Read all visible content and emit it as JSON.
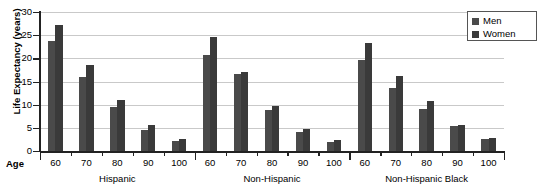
{
  "axes": {
    "ylabel": "Life Expectancy (years)",
    "age_label": "Age",
    "yticks": [
      "30",
      "25",
      "20",
      "15",
      "10",
      "5",
      "0"
    ]
  },
  "legend": {
    "items": [
      {
        "label": "Men",
        "color": "#4a4a4a",
        "icon": "square-swatch-icon"
      },
      {
        "label": "Women",
        "color": "#3a3a3a",
        "icon": "square-swatch-icon"
      }
    ]
  },
  "chart_data": {
    "type": "bar",
    "title": "",
    "xlabel": "Age",
    "ylabel": "Life Expectancy (years)",
    "ylim": [
      0,
      30
    ],
    "yticks": [
      0,
      5,
      10,
      15,
      20,
      25,
      30
    ],
    "grid": true,
    "legend_position": "top-right",
    "groups": [
      "Hispanic",
      "Non-Hispanic",
      "Non-Hispanic Black"
    ],
    "categories": [
      "60",
      "70",
      "80",
      "90",
      "100"
    ],
    "series": [
      {
        "name": "Men",
        "color": "#4a4a4a",
        "values_by_group": {
          "Hispanic": [
            23.7,
            16.0,
            9.4,
            4.5,
            2.1
          ],
          "Non-Hispanic": [
            20.8,
            16.6,
            8.9,
            4.2,
            1.9
          ],
          "Non-Hispanic Black": [
            19.6,
            13.6,
            9.0,
            5.3,
            2.5
          ]
        }
      },
      {
        "name": "Women",
        "color": "#3a3a3a",
        "values_by_group": {
          "Hispanic": [
            27.2,
            18.5,
            11.1,
            5.6,
            2.5
          ],
          "Non-Hispanic": [
            24.7,
            17.0,
            9.8,
            4.7,
            2.3
          ],
          "Non-Hispanic Black": [
            23.4,
            16.2,
            10.7,
            5.6,
            2.9
          ]
        }
      }
    ],
    "xticklabels": [
      "60",
      "70",
      "80",
      "90",
      "100",
      "60",
      "70",
      "80",
      "90",
      "100",
      "60",
      "70",
      "80",
      "90",
      "100"
    ]
  }
}
